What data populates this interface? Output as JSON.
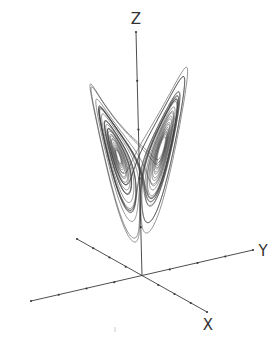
{
  "figure": {
    "background": "#ffffff",
    "stroke_color": "#3a3a3a"
  },
  "chart_data": {
    "type": "line",
    "title": "",
    "parameters": {
      "sigma": 10,
      "rho": 28,
      "beta": 2.6667
    },
    "axes": [
      {
        "name": "X",
        "label": "X",
        "ticks": 4
      },
      {
        "name": "Y",
        "label": "Y",
        "ticks": 5
      },
      {
        "name": "Z",
        "label": "Z",
        "ticks": 5
      }
    ],
    "origin_px": [
      142,
      276
    ],
    "axis_endpoints_px": {
      "x_pos": [
        207,
        312
      ],
      "x_neg": [
        77,
        239
      ],
      "y_pos": [
        253,
        250
      ],
      "y_neg": [
        31,
        301
      ],
      "z_pos": [
        136,
        32
      ]
    },
    "label_positions_px": {
      "X": [
        208,
        330
      ],
      "Y": [
        263,
        256
      ],
      "Z": [
        136,
        24
      ]
    }
  }
}
